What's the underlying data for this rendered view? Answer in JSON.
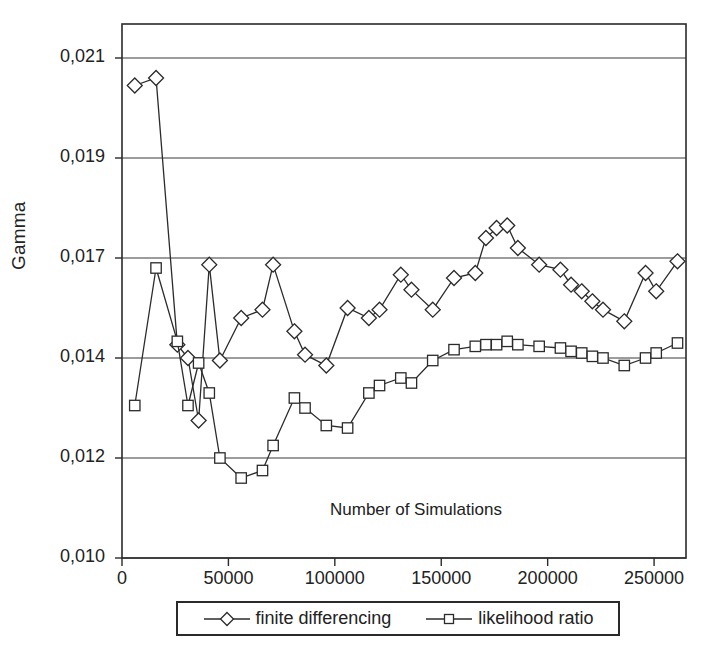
{
  "chart_data": {
    "type": "line",
    "title": "",
    "xlabel": "Number of Simulations",
    "ylabel": "Gamma",
    "x_ticks": [
      "0",
      "50000",
      "100000",
      "150000",
      "200000",
      "250000"
    ],
    "x_tick_values": [
      0,
      50000,
      100000,
      150000,
      200000,
      250000
    ],
    "y_ticks": [
      "0,010",
      "0,012",
      "0,014",
      "0,017",
      "0,019",
      "0,021"
    ],
    "y_tick_values": [
      0.01,
      0.012,
      0.014,
      0.017,
      0.019,
      0.021
    ],
    "xlim": [
      0,
      265000
    ],
    "ylim": [
      0.01,
      0.0222
    ],
    "grid": "horizontal",
    "legend_position": "below-axes",
    "x": [
      6000,
      16000,
      26000,
      31000,
      36000,
      41000,
      46000,
      56000,
      66000,
      71000,
      81000,
      86000,
      96000,
      106000,
      116000,
      121000,
      131000,
      136000,
      146000,
      156000,
      166000,
      171000,
      176000,
      181000,
      186000,
      196000,
      206000,
      211000,
      216000,
      221000,
      226000,
      236000,
      246000,
      251000,
      261000
    ],
    "series": [
      {
        "name": "finite differencing",
        "marker": "diamond",
        "values": [
          0.02045,
          0.0206,
          0.0144,
          0.014,
          0.01275,
          0.0168,
          0.01395,
          0.0152,
          0.01545,
          0.0168,
          0.0148,
          0.0141,
          0.01385,
          0.0155,
          0.0152,
          0.01545,
          0.0165,
          0.01605,
          0.01545,
          0.0164,
          0.01655,
          0.0174,
          0.0176,
          0.01765,
          0.0172,
          0.0168,
          0.01665,
          0.0162,
          0.016,
          0.0157,
          0.01545,
          0.0151,
          0.01655,
          0.016,
          0.0169
        ]
      },
      {
        "name": "likelihood ratio",
        "marker": "square",
        "values": [
          0.01305,
          0.0167,
          0.0145,
          0.01305,
          0.0139,
          0.0133,
          0.012,
          0.0116,
          0.01175,
          0.01225,
          0.0132,
          0.013,
          0.01265,
          0.0126,
          0.0133,
          0.01345,
          0.0136,
          0.0135,
          0.01395,
          0.01425,
          0.01435,
          0.0144,
          0.0144,
          0.0145,
          0.0144,
          0.01435,
          0.0143,
          0.0142,
          0.01415,
          0.01405,
          0.014,
          0.01385,
          0.014,
          0.01415,
          0.01445
        ]
      }
    ]
  },
  "legend": {
    "items": [
      {
        "label": "finite differencing",
        "marker": "diamond"
      },
      {
        "label": "likelihood ratio",
        "marker": "square"
      }
    ]
  }
}
